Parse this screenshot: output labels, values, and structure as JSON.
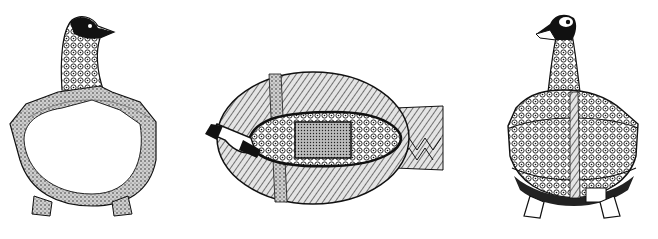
{
  "figures": [
    {
      "id": "section",
      "label": "duck-vessel-cross-section",
      "view": "section"
    },
    {
      "id": "top",
      "label": "duck-vessel-top-view",
      "view": "top"
    },
    {
      "id": "side",
      "label": "duck-vessel-side-view",
      "view": "side"
    }
  ],
  "colors": {
    "ink": "#111111",
    "paper": "#ffffff",
    "stipple": "#555555"
  }
}
